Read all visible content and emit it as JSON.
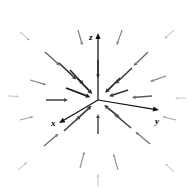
{
  "figure": {
    "title": "",
    "background_color": "#ffffff",
    "width": 192,
    "height": 195
  },
  "axes": {
    "origin": {
      "x": 98,
      "y": 100
    },
    "items": [
      {
        "name": "z",
        "label": "z",
        "tip": {
          "x": 98,
          "y": 33
        },
        "label_pos": {
          "x": 89,
          "y": 38
        },
        "color": "#111111"
      },
      {
        "name": "x",
        "label": "x",
        "tip": {
          "x": 59,
          "y": 123
        },
        "label_pos": {
          "x": 52,
          "y": 124
        },
        "color": "#111111"
      },
      {
        "name": "y",
        "label": "y",
        "tip": {
          "x": 159,
          "y": 110
        },
        "label_pos": {
          "x": 157,
          "y": 122
        },
        "color": "#111111"
      }
    ]
  },
  "chart_data": {
    "type": "scatter",
    "plot_kind": "quiver-3d-vector-field",
    "title": "",
    "xlabel": "x",
    "ylabel": "y",
    "zlabel": "z",
    "grid": false,
    "legend": null,
    "field_description": "Radially convergent 3D vector field; all arrows point inward toward the origin.",
    "field_direction": "inward",
    "arrow_color_near": "#1a1a1a",
    "arrow_color_far": "#c8c8c8",
    "projection": "isometric",
    "center": {
      "x": 98,
      "y": 100
    },
    "radius_max": 96,
    "arrows": [
      {
        "x": 77,
        "y": 78,
        "angle": 45,
        "len": 22,
        "shade": 0.92
      },
      {
        "x": 66,
        "y": 88,
        "angle": 23,
        "len": 26,
        "shade": 0.95
      },
      {
        "x": 70,
        "y": 70,
        "angle": 47,
        "len": 20,
        "shade": 0.85
      },
      {
        "x": 59,
        "y": 63,
        "angle": 43,
        "len": 24,
        "shade": 0.8
      },
      {
        "x": 120,
        "y": 78,
        "angle": 135,
        "len": 21,
        "shade": 0.88
      },
      {
        "x": 132,
        "y": 68,
        "angle": 131,
        "len": 23,
        "shade": 0.78
      },
      {
        "x": 128,
        "y": 90,
        "angle": 172,
        "len": 20,
        "shade": 0.82
      },
      {
        "x": 119,
        "y": 117,
        "angle": 229,
        "len": 19,
        "shade": 0.8
      },
      {
        "x": 131,
        "y": 128,
        "angle": 226,
        "len": 22,
        "shade": 0.72
      },
      {
        "x": 76,
        "y": 120,
        "angle": 312,
        "len": 21,
        "shade": 0.82
      },
      {
        "x": 64,
        "y": 131,
        "angle": 314,
        "len": 23,
        "shade": 0.74
      },
      {
        "x": 98,
        "y": 134,
        "angle": 270,
        "len": 20,
        "shade": 0.7
      },
      {
        "x": 98,
        "y": 60,
        "angle": 90,
        "len": 18,
        "shade": 0.68
      },
      {
        "x": 46,
        "y": 100,
        "angle": 0,
        "len": 22,
        "shade": 0.72
      },
      {
        "x": 152,
        "y": 96,
        "angle": 180,
        "len": 20,
        "shade": 0.62
      },
      {
        "x": 45,
        "y": 52,
        "angle": 44,
        "len": 20,
        "shade": 0.58
      },
      {
        "x": 148,
        "y": 52,
        "angle": 133,
        "len": 20,
        "shade": 0.56
      },
      {
        "x": 44,
        "y": 146,
        "angle": 316,
        "len": 19,
        "shade": 0.52
      },
      {
        "x": 150,
        "y": 144,
        "angle": 224,
        "len": 19,
        "shade": 0.5
      },
      {
        "x": 30,
        "y": 80,
        "angle": 16,
        "len": 17,
        "shade": 0.42
      },
      {
        "x": 166,
        "y": 76,
        "angle": 165,
        "len": 17,
        "shade": 0.4
      },
      {
        "x": 80,
        "y": 168,
        "angle": 283,
        "len": 17,
        "shade": 0.38
      },
      {
        "x": 118,
        "y": 170,
        "angle": 256,
        "len": 17,
        "shade": 0.36
      },
      {
        "x": 78,
        "y": 30,
        "angle": 71,
        "len": 16,
        "shade": 0.44
      },
      {
        "x": 122,
        "y": 30,
        "angle": 108,
        "len": 16,
        "shade": 0.42
      },
      {
        "x": 20,
        "y": 120,
        "angle": 345,
        "len": 14,
        "shade": 0.3
      },
      {
        "x": 176,
        "y": 120,
        "angle": 196,
        "len": 14,
        "shade": 0.28
      },
      {
        "x": 20,
        "y": 32,
        "angle": 44,
        "len": 13,
        "shade": 0.24
      },
      {
        "x": 174,
        "y": 30,
        "angle": 135,
        "len": 13,
        "shade": 0.24
      },
      {
        "x": 18,
        "y": 170,
        "angle": 315,
        "len": 12,
        "shade": 0.2
      },
      {
        "x": 174,
        "y": 172,
        "angle": 224,
        "len": 12,
        "shade": 0.2
      },
      {
        "x": 98,
        "y": 186,
        "angle": 270,
        "len": 12,
        "shade": 0.18
      },
      {
        "x": 8,
        "y": 96,
        "angle": 2,
        "len": 11,
        "shade": 0.16
      },
      {
        "x": 186,
        "y": 98,
        "angle": 180,
        "len": 11,
        "shade": 0.16
      }
    ]
  }
}
